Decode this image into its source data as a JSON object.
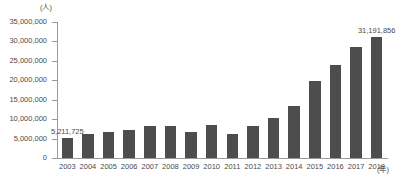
{
  "chart_data": {
    "type": "bar",
    "title": "",
    "xlabel": "(年)",
    "ylabel": "(人)",
    "ylim": [
      0,
      35000000
    ],
    "ytick_labels": [
      "35,000,000",
      "30,000,000",
      "25,000,000",
      "20,000,000",
      "15,000,000",
      "10,000,000",
      "5,000,000",
      "0"
    ],
    "ytick_values": [
      35000000,
      30000000,
      25000000,
      20000000,
      15000000,
      10000000,
      5000000,
      0
    ],
    "grid": false,
    "legend": "none",
    "categories": [
      "2003",
      "2004",
      "2005",
      "2006",
      "2007",
      "2008",
      "2009",
      "2010",
      "2011",
      "2012",
      "2013",
      "2014",
      "2015",
      "2016",
      "2017",
      "2018"
    ],
    "values": [
      5211725,
      6137905,
      6727926,
      7334077,
      8346969,
      8350835,
      6789658,
      8611175,
      6218752,
      8358105,
      10363904,
      13413467,
      19737409,
      24039700,
      28691073,
      31191856
    ],
    "data_labels": [
      {
        "category": "2003",
        "text": "5,211,725"
      },
      {
        "category": "2018",
        "text": "31,191,856"
      }
    ],
    "series": [
      {
        "name": "訪日外客数",
        "values": [
          5211725,
          6137905,
          6727926,
          7334077,
          8346969,
          8350835,
          6789658,
          8611175,
          6218752,
          8358105,
          10363904,
          13413467,
          19737409,
          24039700,
          28691073,
          31191856
        ]
      }
    ],
    "colors": {
      "bar": "#4d4d4d",
      "axis": "#9a9a9a",
      "text": "#4a4a4a",
      "background": "#ffffff"
    }
  }
}
